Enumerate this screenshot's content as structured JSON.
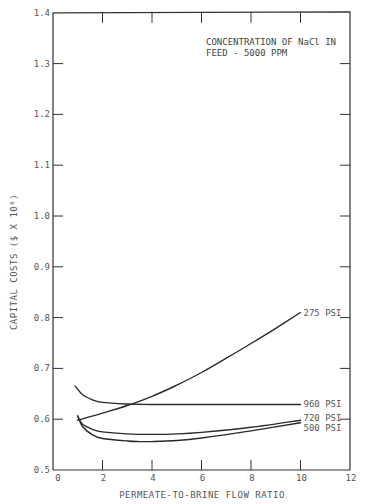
{
  "chart_data": {
    "type": "line",
    "title_lines": [
      "CONCENTRATION OF NaCl IN",
      "FEED - 5000 PPM"
    ],
    "xlabel": "PERMEATE-TO-BRINE FLOW RATIO",
    "ylabel": "CAPITAL COSTS ($ X 10⁶)",
    "xlim": [
      0,
      12
    ],
    "ylim": [
      0.5,
      1.4
    ],
    "xticks": [
      0,
      2,
      4,
      6,
      8,
      10,
      12
    ],
    "xtick_labels": [
      "0",
      "2",
      "4",
      "6",
      "8",
      "10",
      "12"
    ],
    "yticks": [
      0.5,
      0.6,
      0.7,
      0.8,
      0.9,
      1.0,
      1.1,
      1.2,
      1.3,
      1.4
    ],
    "ytick_labels": [
      "0.5",
      "0.6",
      "0.7",
      "0.8",
      "0.9",
      "1.0",
      "1.1",
      "1.2",
      "1.3",
      "1.4"
    ],
    "grid": false,
    "legend": "inline labels at right end of each curve",
    "series": [
      {
        "name": "275 PSI",
        "x": [
          1.0,
          2.0,
          3.0,
          4.0,
          5.0,
          6.0,
          7.0,
          8.0,
          9.0,
          10.0
        ],
        "y": [
          0.598,
          0.612,
          0.627,
          0.645,
          0.667,
          0.692,
          0.72,
          0.749,
          0.779,
          0.81
        ]
      },
      {
        "name": "960 PSI",
        "x": [
          0.9,
          1.2,
          1.6,
          2.0,
          3.0,
          4.0,
          6.0,
          8.0,
          10.0
        ],
        "y": [
          0.665,
          0.648,
          0.638,
          0.633,
          0.63,
          0.629,
          0.629,
          0.629,
          0.629
        ]
      },
      {
        "name": "720 PSI",
        "x": [
          1.0,
          1.2,
          1.6,
          2.0,
          3.0,
          4.0,
          5.0,
          6.0,
          8.0,
          10.0
        ],
        "y": [
          0.605,
          0.59,
          0.58,
          0.575,
          0.571,
          0.57,
          0.571,
          0.574,
          0.584,
          0.598
        ]
      },
      {
        "name": "500 PSI",
        "x": [
          1.0,
          1.2,
          1.6,
          2.0,
          3.0,
          3.5,
          4.0,
          5.0,
          6.0,
          8.0,
          10.0
        ],
        "y": [
          0.607,
          0.585,
          0.569,
          0.562,
          0.557,
          0.556,
          0.556,
          0.558,
          0.563,
          0.577,
          0.593
        ]
      }
    ]
  },
  "labels": {
    "s275": "275 PSI",
    "s960": "960 PSI",
    "s720": "720 PSI",
    "s500": "500 PSI"
  }
}
